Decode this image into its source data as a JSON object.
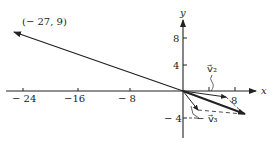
{
  "diagram": {
    "type": "vector-addition",
    "axes": {
      "x_label": "x",
      "y_label": "y",
      "x_ticks": [
        "− 24",
        "−16",
        "− 8",
        "8"
      ],
      "y_ticks": [
        "8",
        "4",
        "− 4"
      ]
    },
    "point_label": "(− 27, 9)",
    "vector_labels": {
      "v2": "v⃗₂",
      "v3": "− v⃗₃"
    },
    "colors": {
      "ink": "#222222",
      "background": "#ffffff"
    }
  }
}
